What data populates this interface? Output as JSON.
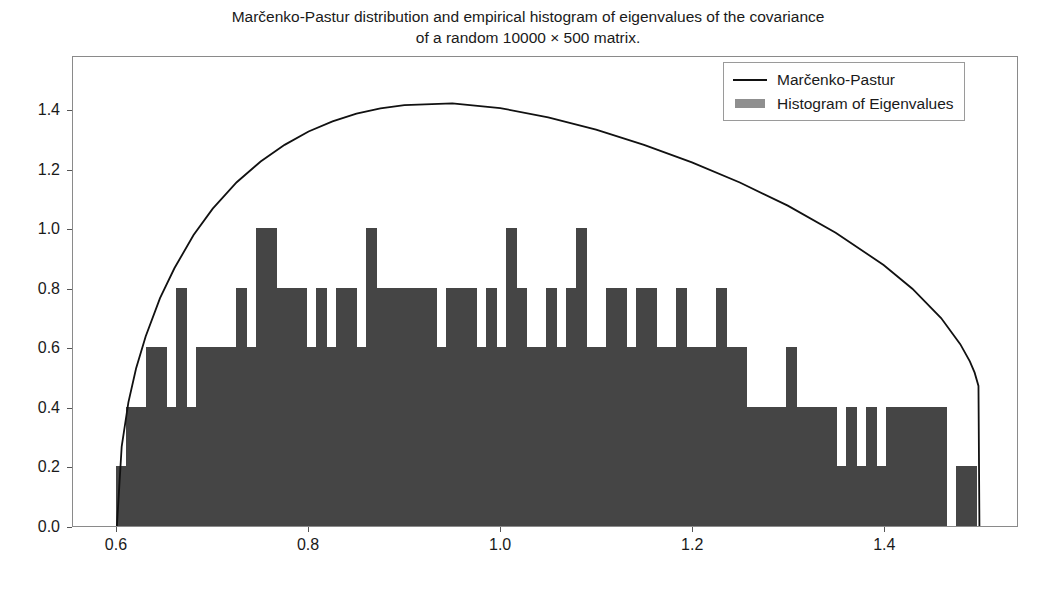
{
  "chart": {
    "title": "Marčenko-Pastur distribution and empirical histogram of eigenvalues of the covariance\nof a random 10000 × 500 matrix.",
    "legend": {
      "position": "upper right",
      "entries": [
        {
          "label": "Marčenko-Pastur",
          "key": "line",
          "color": "#111111"
        },
        {
          "label": "Histogram of Eigenvalues",
          "key": "patch",
          "color": "#8f8f8f"
        }
      ]
    },
    "xticks": [
      "0.6",
      "0.8",
      "1.0",
      "1.2",
      "1.4"
    ],
    "yticks": [
      "0.0",
      "0.2",
      "0.4",
      "0.6",
      "0.8",
      "1.0",
      "1.2",
      "1.4"
    ],
    "colors": {
      "bars": "#454545",
      "curve": "#111111",
      "frame": "#8a8a8a",
      "background": "#ffffff"
    }
  },
  "chart_data": {
    "type": "bar",
    "title": "Marčenko-Pastur distribution and empirical histogram of eigenvalues of the covariance of a random 10000 × 500 matrix.",
    "xlabel": "",
    "ylabel": "",
    "xlim": [
      0.5542,
      1.5392
    ],
    "ylim": [
      0.0,
      1.5812
    ],
    "grid": false,
    "legend_position": "upper right",
    "xtick_values": [
      0.6,
      0.8,
      1.0,
      1.2,
      1.4
    ],
    "ytick_values": [
      0.0,
      0.2,
      0.4,
      0.6,
      0.8,
      1.0,
      1.2,
      1.4
    ],
    "bin_width": 0.0104,
    "series": [
      {
        "name": "Histogram of Eigenvalues",
        "type": "bar",
        "color": "#454545",
        "bin_left_edges": [
          0.599,
          0.6094,
          0.6198,
          0.6302,
          0.6406,
          0.651,
          0.6615,
          0.6719,
          0.6823,
          0.6927,
          0.7031,
          0.7135,
          0.724,
          0.7344,
          0.7448,
          0.7552,
          0.7656,
          0.776,
          0.7865,
          0.7969,
          0.8073,
          0.8177,
          0.8281,
          0.8385,
          0.849,
          0.8594,
          0.8698,
          0.8802,
          0.8906,
          0.901,
          0.9115,
          0.9219,
          0.9323,
          0.9427,
          0.9531,
          0.9635,
          0.974,
          0.9844,
          0.9948,
          1.0052,
          1.0156,
          1.026,
          1.0365,
          1.0469,
          1.0573,
          1.0677,
          1.0781,
          1.0885,
          1.099,
          1.1094,
          1.1198,
          1.1302,
          1.1406,
          1.151,
          1.1615,
          1.1719,
          1.1823,
          1.1927,
          1.2031,
          1.2135,
          1.224,
          1.2344,
          1.2448,
          1.2552,
          1.2656,
          1.276,
          1.2865,
          1.2969,
          1.3073,
          1.3177,
          1.3281,
          1.3385,
          1.349,
          1.3594,
          1.3698,
          1.3802,
          1.3906,
          1.401,
          1.4115,
          1.4219,
          1.4323,
          1.4427,
          1.4531,
          1.4635,
          1.474,
          1.4844
        ],
        "values": [
          0.2,
          0.4,
          0.4,
          0.6,
          0.6,
          0.4,
          0.8,
          0.4,
          0.6,
          0.6,
          0.6,
          0.6,
          0.8,
          0.6,
          1.0,
          1.0,
          0.8,
          0.8,
          0.8,
          0.6,
          0.8,
          0.6,
          0.8,
          0.8,
          0.6,
          1.0,
          0.8,
          0.8,
          0.8,
          0.8,
          0.8,
          0.8,
          0.6,
          0.8,
          0.8,
          0.8,
          0.6,
          0.8,
          0.6,
          1.0,
          0.8,
          0.6,
          0.6,
          0.8,
          0.6,
          0.8,
          1.0,
          0.6,
          0.6,
          0.8,
          0.8,
          0.6,
          0.8,
          0.8,
          0.6,
          0.6,
          0.8,
          0.6,
          0.6,
          0.6,
          0.8,
          0.6,
          0.6,
          0.4,
          0.4,
          0.4,
          0.4,
          0.6,
          0.4,
          0.4,
          0.4,
          0.4,
          0.2,
          0.4,
          0.2,
          0.4,
          0.2,
          0.4,
          0.4,
          0.4,
          0.4,
          0.4,
          0.4,
          0.0,
          0.2,
          0.2
        ]
      },
      {
        "name": "Marčenko-Pastur",
        "type": "line",
        "color": "#111111",
        "lambda_minus": 0.6,
        "lambda_plus": 1.5,
        "peak_x": 0.8573,
        "peak_y": 1.5,
        "x": [
          0.6,
          0.605,
          0.612,
          0.62,
          0.63,
          0.645,
          0.66,
          0.68,
          0.7,
          0.725,
          0.75,
          0.775,
          0.8,
          0.825,
          0.85,
          0.875,
          0.9,
          0.95,
          1.0,
          1.05,
          1.1,
          1.15,
          1.2,
          1.25,
          1.3,
          1.35,
          1.4,
          1.43,
          1.46,
          1.48,
          1.49,
          1.495,
          1.499,
          1.5
        ],
        "y": [
          0.0,
          0.268,
          0.417,
          0.531,
          0.639,
          0.768,
          0.869,
          0.981,
          1.07,
          1.159,
          1.229,
          1.285,
          1.33,
          1.364,
          1.39,
          1.408,
          1.419,
          1.425,
          1.409,
          1.378,
          1.336,
          1.285,
          1.226,
          1.158,
          1.08,
          0.989,
          0.88,
          0.8,
          0.701,
          0.613,
          0.555,
          0.517,
          0.472,
          0.0
        ]
      }
    ]
  }
}
